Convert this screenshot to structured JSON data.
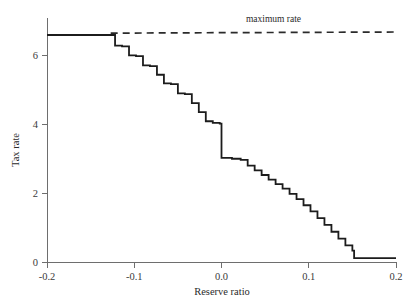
{
  "chart_data": {
    "type": "line",
    "title": "",
    "xlabel": "Reserve ratio",
    "ylabel": "Tax rate",
    "xlim": [
      -0.2,
      0.2
    ],
    "ylim": [
      0,
      6.45
    ],
    "grid": false,
    "legend_position": "none",
    "xticks": [
      -0.2,
      -0.1,
      0.0,
      0.1,
      0.2
    ],
    "xtick_labels": [
      "-0.2",
      "-0.1",
      "0.0",
      "0.1",
      "0.2"
    ],
    "yticks": [
      0,
      2,
      4,
      6
    ],
    "ytick_labels": [
      "0",
      "2",
      "4",
      "6"
    ],
    "annotations": [
      {
        "text": "maximum rate",
        "x": 0.028,
        "y": 6.35,
        "style": "plain"
      }
    ],
    "series": [
      {
        "name": "tax rate schedule",
        "style": "step-post",
        "line_style": "solid",
        "color": "#1c1c1c",
        "x": [
          -0.2,
          -0.127,
          -0.122,
          -0.114,
          -0.106,
          -0.098,
          -0.09,
          -0.082,
          -0.074,
          -0.066,
          -0.058,
          -0.05,
          -0.042,
          -0.034,
          -0.026,
          -0.018,
          -0.01,
          -0.002,
          0.0,
          0.012,
          0.022,
          0.03,
          0.038,
          0.046,
          0.054,
          0.062,
          0.07,
          0.078,
          0.086,
          0.094,
          0.102,
          0.11,
          0.118,
          0.126,
          0.134,
          0.142,
          0.15,
          0.152,
          0.2
        ],
        "y": [
          6.0,
          6.0,
          5.72,
          5.7,
          5.46,
          5.44,
          5.2,
          5.18,
          4.95,
          4.72,
          4.7,
          4.46,
          4.44,
          4.2,
          3.96,
          3.72,
          3.68,
          3.66,
          2.75,
          2.73,
          2.7,
          2.55,
          2.42,
          2.3,
          2.18,
          2.06,
          1.94,
          1.8,
          1.66,
          1.5,
          1.34,
          1.16,
          0.98,
          0.8,
          0.62,
          0.44,
          0.3,
          0.1,
          0.1
        ]
      },
      {
        "name": "maximum rate",
        "style": "straight",
        "line_style": "dashed",
        "color": "#2a2a2a",
        "x": [
          -0.127,
          0.2
        ],
        "y": [
          6.05,
          6.08
        ]
      }
    ]
  },
  "axes": {
    "y_axis_title": "Tax rate",
    "x_axis_title": "Reserve ratio"
  }
}
